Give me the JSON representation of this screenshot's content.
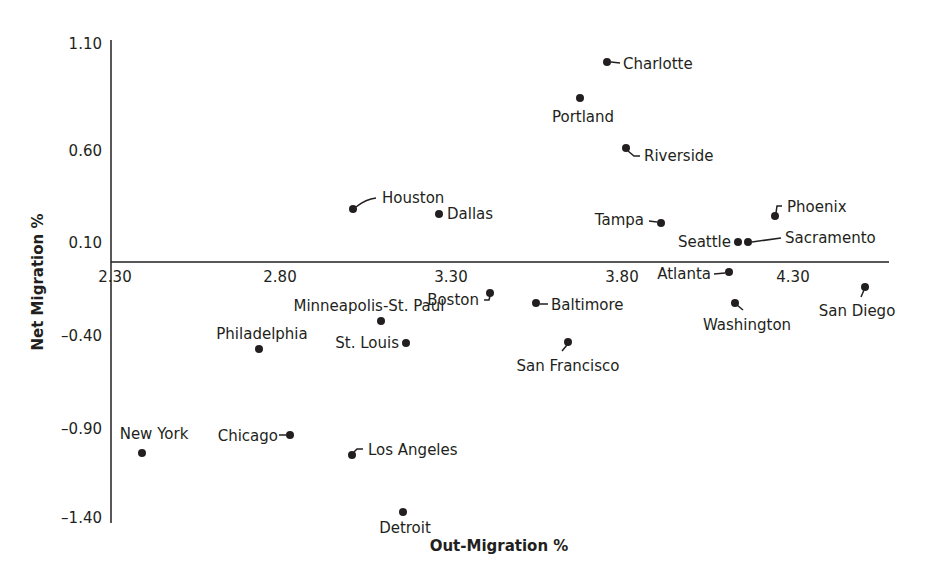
{
  "chart_data": {
    "type": "scatter",
    "title": "",
    "xlabel": "Out-Migration %",
    "ylabel": "Net Migration %",
    "xlim": [
      2.3,
      4.6
    ],
    "ylim": [
      -1.4,
      1.1
    ],
    "x_ticks": [
      "2.30",
      "2.80",
      "3.30",
      "3.80",
      "4.30"
    ],
    "y_ticks": [
      "1.10",
      "0.60",
      "0.10",
      "-0.40",
      "-0.90",
      "-1.40"
    ],
    "grid": false,
    "legend": null,
    "marker_color": "#231f20",
    "points": [
      {
        "label": "Charlotte",
        "x": 3.76,
        "y": 1.08
      },
      {
        "label": "Portland",
        "x": 3.68,
        "y": 0.88
      },
      {
        "label": "Riverside",
        "x": 3.81,
        "y": 0.61
      },
      {
        "label": "Houston",
        "x": 3.01,
        "y": 0.28
      },
      {
        "label": "Dallas",
        "x": 3.26,
        "y": 0.26
      },
      {
        "label": "Tampa",
        "x": 3.91,
        "y": 0.21
      },
      {
        "label": "Phoenix",
        "x": 4.25,
        "y": 0.25
      },
      {
        "label": "Seattle",
        "x": 4.14,
        "y": 0.11
      },
      {
        "label": "Sacramento",
        "x": 4.17,
        "y": 0.11
      },
      {
        "label": "Atlanta",
        "x": 4.11,
        "y": -0.05
      },
      {
        "label": "Washington",
        "x": 4.13,
        "y": -0.22
      },
      {
        "label": "San Diego",
        "x": 4.51,
        "y": -0.13
      },
      {
        "label": "Boston",
        "x": 3.41,
        "y": -0.17
      },
      {
        "label": "Baltimore",
        "x": 3.55,
        "y": -0.22
      },
      {
        "label": "Minneapolis-St. Paul",
        "x": 3.1,
        "y": -0.32
      },
      {
        "label": "Philadelphia",
        "x": 2.74,
        "y": -0.47
      },
      {
        "label": "St. Louis",
        "x": 3.17,
        "y": -0.44
      },
      {
        "label": "San Francisco",
        "x": 3.64,
        "y": -0.43
      },
      {
        "label": "New York",
        "x": 2.4,
        "y": -1.03
      },
      {
        "label": "Chicago",
        "x": 2.83,
        "y": -0.93
      },
      {
        "label": "Los Angeles",
        "x": 3.01,
        "y": -1.04
      },
      {
        "label": "Detroit",
        "x": 3.16,
        "y": -1.34
      }
    ]
  },
  "layout": {
    "points_px": [
      {
        "cx": 607,
        "cy": 62,
        "lx": 623,
        "ly": 69,
        "anchor": "start",
        "leader": "M611,62 L620,63"
      },
      {
        "cx": 580,
        "cy": 98,
        "lx": 583,
        "ly": 122,
        "anchor": "middle",
        "leader": ""
      },
      {
        "cx": 626,
        "cy": 148,
        "lx": 644,
        "ly": 161,
        "anchor": "start",
        "leader": "M628,151 L634,156 L640,156"
      },
      {
        "cx": 353,
        "cy": 209,
        "lx": 382,
        "ly": 203,
        "anchor": "start",
        "leader": "M356,207 Q366,199 376,198"
      },
      {
        "cx": 439,
        "cy": 214,
        "lx": 447,
        "ly": 219,
        "anchor": "start",
        "leader": ""
      },
      {
        "cx": 661,
        "cy": 223,
        "lx": 644,
        "ly": 225,
        "anchor": "end",
        "leader": "M649,221 L657,222"
      },
      {
        "cx": 775,
        "cy": 216,
        "lx": 787,
        "ly": 212,
        "anchor": "start",
        "leader": "M776,213 L777,206 L782,206"
      },
      {
        "cx": 738,
        "cy": 242,
        "lx": 731,
        "ly": 247,
        "anchor": "end",
        "leader": ""
      },
      {
        "cx": 748,
        "cy": 242,
        "lx": 785,
        "ly": 243,
        "anchor": "start",
        "leader": "M752,242 L781,238"
      },
      {
        "cx": 729,
        "cy": 272,
        "lx": 711,
        "ly": 279,
        "anchor": "end",
        "leader": "M714,274 L725,273"
      },
      {
        "cx": 735,
        "cy": 303,
        "lx": 747,
        "ly": 330,
        "anchor": "middle",
        "leader": "M737,305 L743,310"
      },
      {
        "cx": 865,
        "cy": 287,
        "lx": 857,
        "ly": 316,
        "anchor": "middle",
        "leader": "M864,290 L861,297"
      },
      {
        "cx": 490,
        "cy": 293,
        "lx": 479,
        "ly": 305,
        "anchor": "end",
        "leader": "M490,296 L489,300 L484,300"
      },
      {
        "cx": 536,
        "cy": 303,
        "lx": 551,
        "ly": 310,
        "anchor": "start",
        "leader": "M540,304 L548,304"
      },
      {
        "cx": 381,
        "cy": 321,
        "lx": 369,
        "ly": 311,
        "anchor": "middle",
        "leader": ""
      },
      {
        "cx": 259,
        "cy": 349,
        "lx": 262,
        "ly": 339,
        "anchor": "middle",
        "leader": ""
      },
      {
        "cx": 406,
        "cy": 343,
        "lx": 399,
        "ly": 348,
        "anchor": "end",
        "leader": ""
      },
      {
        "cx": 568,
        "cy": 342,
        "lx": 568,
        "ly": 371,
        "anchor": "middle",
        "leader": "M567,345 L562,351"
      },
      {
        "cx": 142,
        "cy": 453,
        "lx": 154,
        "ly": 439,
        "anchor": "middle",
        "leader": ""
      },
      {
        "cx": 290,
        "cy": 435,
        "lx": 278,
        "ly": 441,
        "anchor": "end",
        "leader": "M279,435 L286,435"
      },
      {
        "cx": 352,
        "cy": 455,
        "lx": 368,
        "ly": 455,
        "anchor": "start",
        "leader": "M354,452 L357,449 L363,449"
      },
      {
        "cx": 403,
        "cy": 512,
        "lx": 405,
        "ly": 533,
        "anchor": "middle",
        "leader": ""
      }
    ],
    "x_ticks_px": [
      {
        "x": 115,
        "y": 282
      },
      {
        "x": 280,
        "y": 282
      },
      {
        "x": 451,
        "y": 282
      },
      {
        "x": 622,
        "y": 282
      },
      {
        "x": 793,
        "y": 282
      }
    ],
    "y_ticks_px": [
      {
        "x": 102,
        "y": 49
      },
      {
        "x": 102,
        "y": 156
      },
      {
        "x": 102,
        "y": 248
      },
      {
        "x": 102,
        "y": 341
      },
      {
        "x": 102,
        "y": 434
      },
      {
        "x": 102,
        "y": 523
      }
    ]
  }
}
